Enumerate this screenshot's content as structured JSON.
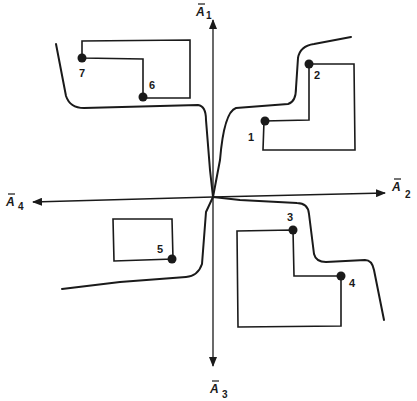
{
  "diagram": {
    "axes": {
      "up": {
        "symbol": "A",
        "subscript": "1"
      },
      "right": {
        "symbol": "A",
        "subscript": "2"
      },
      "down": {
        "symbol": "A",
        "subscript": "3"
      },
      "left": {
        "symbol": "A",
        "subscript": "4"
      }
    },
    "points": [
      {
        "label": "1"
      },
      {
        "label": "2"
      },
      {
        "label": "3"
      },
      {
        "label": "4"
      },
      {
        "label": "5"
      },
      {
        "label": "6"
      },
      {
        "label": "7"
      }
    ],
    "colors": {
      "ink": "#1a1a1a",
      "background": "#ffffff"
    }
  }
}
